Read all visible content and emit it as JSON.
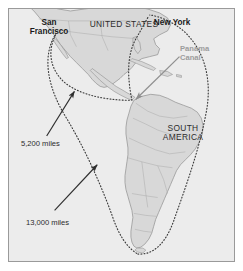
{
  "figure": {
    "name": "shipping-routes-map",
    "background_color": "#ececec",
    "border_color": "#9a9a9a",
    "land_fill": "#d8d8d8",
    "coast_stroke": "#8e8e8e",
    "route_color": "#3a3a3a",
    "arrow_color": "#333333",
    "panama_arrow_color": "#8f8f8f"
  },
  "labels": {
    "san_francisco": "San\nFrancisco",
    "united_states": "UNITED STATES",
    "new_york": "New York",
    "panama_canal": "Panama\nCanal",
    "south_america": "SOUTH\nAMERICA",
    "distance_short": "5,200 miles",
    "distance_long": "13,000 miles"
  },
  "routes": [
    {
      "name": "panama-canal-route",
      "label": "5,200 miles",
      "from": "San Francisco",
      "to": "New York",
      "via": "Panama Canal",
      "distance_miles": 5200,
      "style": "dotted"
    },
    {
      "name": "cape-horn-route",
      "label": "13,000 miles",
      "from": "San Francisco",
      "to": "New York",
      "via": "Cape Horn",
      "distance_miles": 13000,
      "style": "dotted"
    }
  ],
  "icons": {
    "arrow_short_route": "arrow-icon",
    "arrow_long_route": "arrow-icon",
    "arrow_panama": "arrow-icon"
  }
}
